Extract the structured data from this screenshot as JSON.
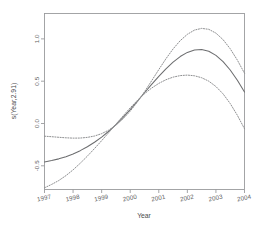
{
  "chart_data": {
    "type": "line",
    "title": "",
    "xlabel": "Year",
    "ylabel": "s(Year,2.91)",
    "xlim": [
      1997,
      2004
    ],
    "ylim": [
      -0.78,
      1.3
    ],
    "grid": false,
    "legend": "none",
    "x_ticks": [
      "1997",
      "1998",
      "1999",
      "2000",
      "2001",
      "2002",
      "2003",
      "2004"
    ],
    "x_tick_values": [
      1997,
      1998,
      1999,
      2000,
      2001,
      2002,
      2003,
      2004
    ],
    "y_ticks": [
      "1.0",
      "0.5",
      "0.0",
      "-0.5"
    ],
    "y_tick_values": [
      1.0,
      0.5,
      0.0,
      -0.5
    ],
    "x": [
      1997.0,
      1997.25,
      1997.5,
      1997.75,
      1998.0,
      1998.25,
      1998.5,
      1998.75,
      1999.0,
      1999.25,
      1999.5,
      1999.75,
      2000.0,
      2000.25,
      2000.5,
      2000.75,
      2001.0,
      2001.25,
      2001.5,
      2001.75,
      2002.0,
      2002.25,
      2002.5,
      2002.75,
      2003.0,
      2003.25,
      2003.5,
      2003.75,
      2004.0
    ],
    "series": [
      {
        "name": "fit",
        "style": "solid",
        "values": [
          -0.455,
          -0.438,
          -0.418,
          -0.392,
          -0.36,
          -0.321,
          -0.275,
          -0.222,
          -0.161,
          -0.092,
          -0.014,
          0.072,
          0.165,
          0.263,
          0.363,
          0.462,
          0.557,
          0.646,
          0.725,
          0.791,
          0.84,
          0.869,
          0.874,
          0.853,
          0.805,
          0.731,
          0.632,
          0.511,
          0.372
        ]
      },
      {
        "name": "upper 2 SE",
        "style": "dashed",
        "values": [
          -0.15,
          -0.156,
          -0.163,
          -0.169,
          -0.173,
          -0.172,
          -0.164,
          -0.148,
          -0.12,
          -0.078,
          -0.02,
          0.055,
          0.146,
          0.254,
          0.375,
          0.505,
          0.637,
          0.765,
          0.881,
          0.979,
          1.054,
          1.104,
          1.124,
          1.113,
          1.068,
          0.991,
          0.883,
          0.749,
          0.594
        ]
      },
      {
        "name": "lower 2 SE",
        "style": "dashed",
        "values": [
          -0.76,
          -0.72,
          -0.674,
          -0.616,
          -0.548,
          -0.47,
          -0.386,
          -0.296,
          -0.203,
          -0.107,
          -0.008,
          0.09,
          0.185,
          0.273,
          0.352,
          0.419,
          0.474,
          0.517,
          0.548,
          0.566,
          0.572,
          0.564,
          0.541,
          0.5,
          0.437,
          0.35,
          0.236,
          0.097,
          -0.062
        ]
      }
    ]
  }
}
